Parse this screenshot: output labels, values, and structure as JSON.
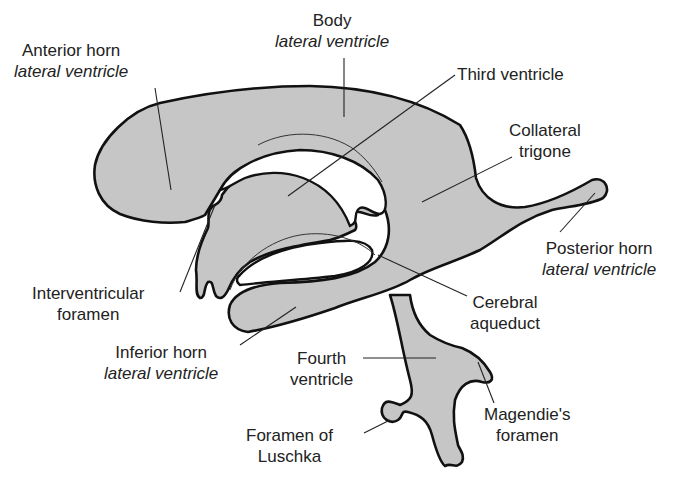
{
  "figure": {
    "colors": {
      "fill": "#c6c6c6",
      "outline": "#111111",
      "background": "#ffffff",
      "text": "#222222"
    }
  },
  "labels": {
    "anterior_horn": {
      "line1": "Anterior horn",
      "line2": "lateral ventricle"
    },
    "body": {
      "line1": "Body",
      "line2": "lateral ventricle"
    },
    "third_ventricle": {
      "line1": "Third ventricle"
    },
    "collateral_trigone": {
      "line1": "Collateral",
      "line2": "trigone"
    },
    "posterior_horn": {
      "line1": "Posterior horn",
      "line2": "lateral ventricle"
    },
    "interventricular_foramen": {
      "line1": "Interventricular",
      "line2": "foramen"
    },
    "cerebral_aqueduct": {
      "line1": "Cerebral",
      "line2": "aqueduct"
    },
    "inferior_horn": {
      "line1": "Inferior horn",
      "line2": "lateral ventricle"
    },
    "fourth_ventricle": {
      "line1": "Fourth",
      "line2": "ventricle"
    },
    "magendie_foramen": {
      "line1": "Magendie's",
      "line2": "foramen"
    },
    "luschka_foramen": {
      "line1": "Foramen of",
      "line2": "Luschka"
    }
  }
}
